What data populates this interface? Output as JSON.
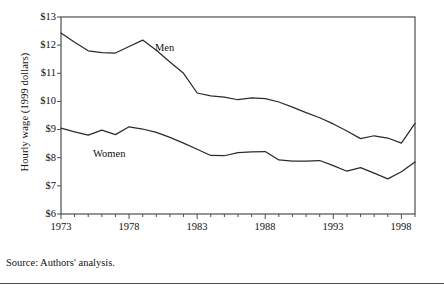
{
  "figure": {
    "source_note": "Source: Authors' analysis.",
    "ylabel": "Hourly wage (1999 dollars)",
    "label_men": "Men",
    "label_women": "Women",
    "ytick_labels": [
      "$13",
      "$12",
      "$11",
      "$10",
      "$9",
      "$8",
      "$7",
      "$6"
    ],
    "xtick_labels": [
      "1973",
      "1978",
      "1983",
      "1988",
      "1993",
      "1998"
    ]
  },
  "chart_data": {
    "type": "line",
    "title": "",
    "xlabel": "",
    "ylabel": "Hourly wage (1999 dollars)",
    "xlim": [
      1973,
      1999
    ],
    "ylim": [
      6,
      13
    ],
    "ytick_values": [
      6,
      7,
      8,
      9,
      10,
      11,
      12,
      13
    ],
    "ytick_labels": [
      "$6",
      "$7",
      "$8",
      "$9",
      "$10",
      "$11",
      "$12",
      "$13"
    ],
    "xtick_values": [
      1973,
      1978,
      1983,
      1988,
      1993,
      1998
    ],
    "xtick_labels": [
      "1973",
      "1978",
      "1983",
      "1988",
      "1993",
      "1998"
    ],
    "minor_xticks": "every year from 1973 to 1999",
    "grid": false,
    "legend_position": "inline labels on plot",
    "x": [
      1973,
      1974,
      1975,
      1976,
      1977,
      1978,
      1979,
      1980,
      1981,
      1982,
      1983,
      1984,
      1985,
      1986,
      1987,
      1988,
      1989,
      1990,
      1991,
      1992,
      1993,
      1994,
      1995,
      1996,
      1997,
      1998,
      1999
    ],
    "series": [
      {
        "name": "Men",
        "values": [
          12.43,
          12.1,
          11.8,
          11.73,
          11.72,
          11.95,
          12.18,
          11.82,
          11.4,
          11.0,
          10.3,
          10.2,
          10.15,
          10.06,
          10.13,
          10.1,
          9.98,
          9.8,
          9.6,
          9.42,
          9.2,
          8.95,
          8.68,
          8.78,
          8.7,
          8.52,
          9.22
        ]
      },
      {
        "name": "Women",
        "values": [
          9.05,
          8.92,
          8.8,
          8.98,
          8.82,
          9.1,
          9.02,
          8.9,
          8.72,
          8.52,
          8.3,
          8.08,
          8.07,
          8.18,
          8.21,
          8.22,
          7.92,
          7.88,
          7.88,
          7.9,
          7.72,
          7.52,
          7.65,
          7.45,
          7.25,
          7.5,
          7.85
        ]
      }
    ],
    "annotations": [
      {
        "text": "Men",
        "x": 1984,
        "y": 11.8
      },
      {
        "text": "Women",
        "x": 1977,
        "y": 8.3
      }
    ]
  }
}
